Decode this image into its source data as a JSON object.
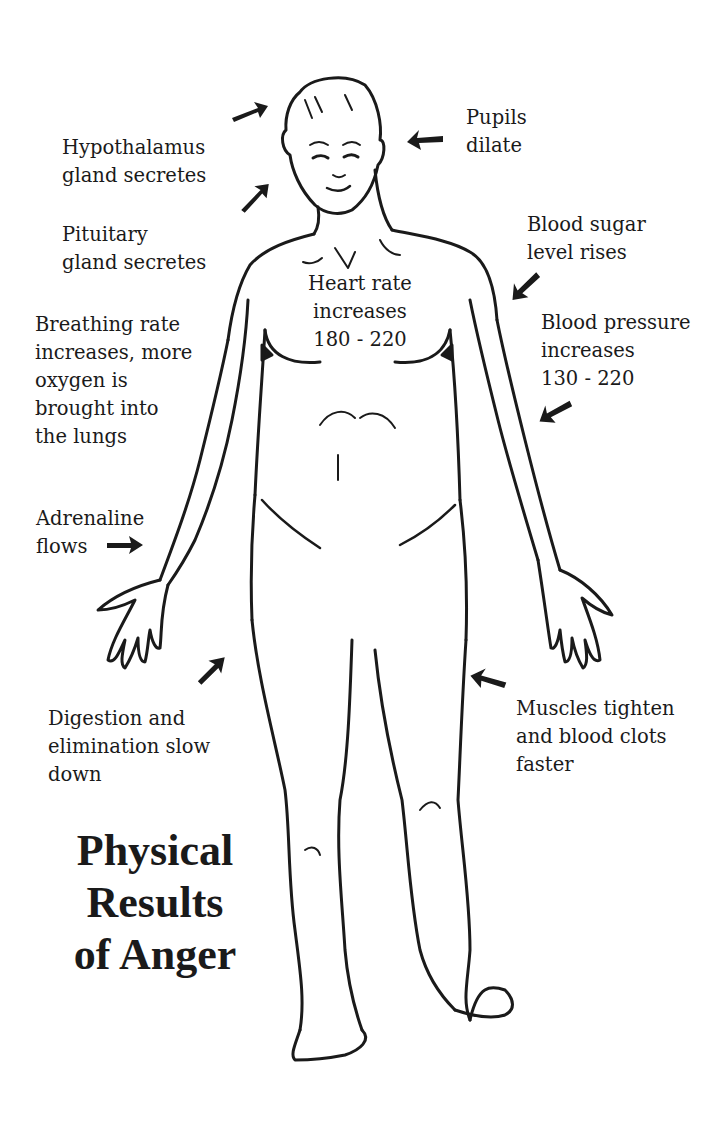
{
  "title": {
    "lines": [
      "Physical",
      "Results",
      "of Anger"
    ]
  },
  "labels": {
    "hypothalamus": [
      "Hypothalamus",
      "gland secretes"
    ],
    "pituitary": [
      "Pituitary",
      "gland secretes"
    ],
    "pupils": [
      "Pupils",
      "dilate"
    ],
    "blood_sugar": [
      "Blood sugar",
      "level rises"
    ],
    "heart_rate": [
      "Heart rate",
      "increases",
      "180 - 220"
    ],
    "breathing": [
      "Breathing rate",
      "increases, more",
      "oxygen is",
      "brought into",
      "the lungs"
    ],
    "blood_pressure": [
      "Blood pressure",
      "increases",
      "130 - 220"
    ],
    "adrenaline": [
      "Adrenaline",
      "flows"
    ],
    "digestion": [
      "Digestion and",
      "elimination slow",
      "down"
    ],
    "muscles": [
      "Muscles tighten",
      "and blood clots",
      "faster"
    ]
  },
  "colors": {
    "ink": "#1a1a1a",
    "background": "#ffffff"
  },
  "icons": {
    "arrows": [
      "arrow-to-head-top",
      "arrow-to-head-side",
      "arrow-to-eyes",
      "arrow-to-shoulder",
      "arrow-to-arm",
      "arrow-to-hand",
      "arrow-to-abdomen",
      "arrow-to-thigh"
    ]
  }
}
